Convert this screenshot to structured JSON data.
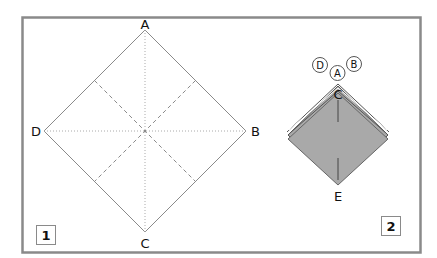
{
  "frame": {
    "border_color": "#8a8a8a",
    "background": "#ffffff"
  },
  "panel1": {
    "step_number": "1",
    "corners": {
      "top": "A",
      "right": "B",
      "bottom": "C",
      "left": "D"
    },
    "line_color": "#8a8a8a"
  },
  "panel2": {
    "step_number": "2",
    "circled_labels": [
      "D",
      "A",
      "B"
    ],
    "center_label": "C",
    "bottom_label": "E",
    "fill_color": "#a9a9a9"
  }
}
